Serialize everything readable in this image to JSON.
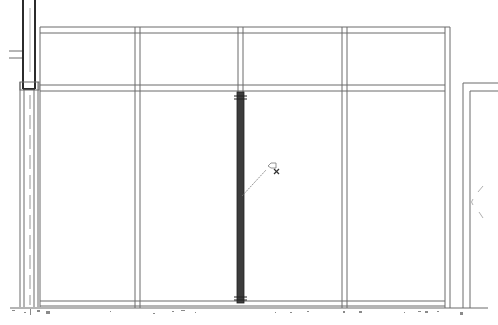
{
  "drawing": {
    "type": "architectural-elevation",
    "subject": "glazed partition / curtain wall elevation",
    "panels_per_row": 4,
    "rows": 2,
    "selected_element": "mullion",
    "colors": {
      "line": "#6a6a6a",
      "selected_mullion": "#3c3c3c",
      "background": "#ffffff"
    }
  },
  "annotation": {
    "tag_icon": "element-tag-icon"
  },
  "caption": {
    "text": ""
  }
}
